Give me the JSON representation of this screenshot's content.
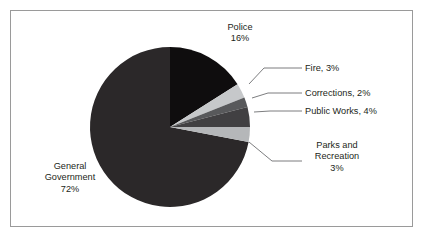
{
  "chart_data": {
    "type": "pie",
    "title": "",
    "subtitle": "",
    "xlabel": "",
    "ylabel": "",
    "legend": "none",
    "grid": false,
    "categories": [
      "Police",
      "Fire",
      "Corrections",
      "Public Works",
      "Parks and Recreation",
      "General Government"
    ],
    "values": [
      16,
      3,
      2,
      4,
      3,
      72
    ],
    "unit": "%",
    "start_angle_deg": 0,
    "direction": "clockwise",
    "slices": [
      {
        "name": "Police",
        "value": 16,
        "value_text": "16%",
        "label_text": "Police",
        "label_full": "Police 16%",
        "color": "#0f0d0e",
        "label_position": "top",
        "leader_line": false
      },
      {
        "name": "Fire",
        "value": 3,
        "value_text": "3%",
        "label_text": "Fire, 3%",
        "label_full": "Fire, 3%",
        "color": "#c6c8ca",
        "label_position": "right",
        "leader_line": true
      },
      {
        "name": "Corrections",
        "value": 2,
        "value_text": "2%",
        "label_text": "Corrections, 2%",
        "label_full": "Corrections, 2%",
        "color": "#58595b",
        "label_position": "right",
        "leader_line": true
      },
      {
        "name": "Public Works",
        "value": 4,
        "value_text": "4%",
        "label_text": "Public Works, 4%",
        "label_full": "Public Works, 4%",
        "color": "#414042",
        "label_position": "right",
        "leader_line": true
      },
      {
        "name": "Parks and Recreation",
        "value": 3,
        "value_text": "3%",
        "label_text": "Parks and Recreation",
        "label_full": "Parks and Recreation 3%",
        "color": "#b5b7b9",
        "label_position": "right",
        "leader_line": true
      },
      {
        "name": "General Government",
        "value": 72,
        "value_text": "72%",
        "label_text": "General Government",
        "label_full": "General Government 72%",
        "color": "#2b2829",
        "label_position": "left",
        "leader_line": false
      }
    ]
  },
  "labels": {
    "police": {
      "line1": "Police",
      "line2": "16%"
    },
    "general_government": {
      "line1": "General",
      "line2": "Government",
      "line3": "72%"
    },
    "fire": {
      "line1": "Fire, 3%"
    },
    "corrections": {
      "line1": "Corrections, 2%"
    },
    "public_works": {
      "line1": "Public Works, 4%"
    },
    "parks": {
      "line1": "Parks and",
      "line2": "Recreation",
      "line3": "3%"
    }
  },
  "style": {
    "frame_border_color": "#9a9a9a",
    "background_color": "#ffffff",
    "text_color": "#231f20",
    "leader_line_color": "#6d6e71"
  }
}
